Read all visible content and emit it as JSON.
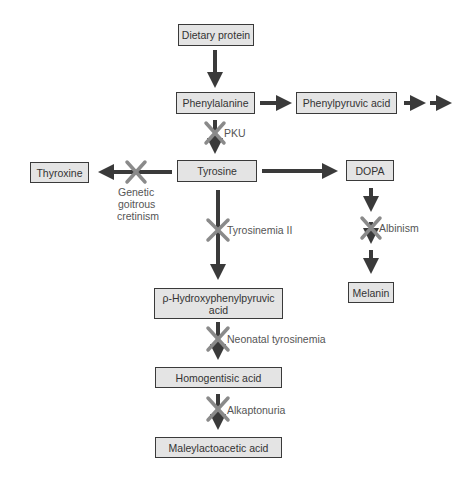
{
  "diagram": {
    "type": "metabolic-pathway",
    "nodes": {
      "dietary_protein": "Dietary protein",
      "phenylalanine": "Phenylalanine",
      "phenylpyruvic_acid": "Phenylpyruvic acid",
      "tyrosine": "Tyrosine",
      "thyroxine": "Thyroxine",
      "dopa": "DOPA",
      "melanin": "Melanin",
      "p_hydroxyphenylpyruvic_acid": "ρ-Hydroxyphenylpyruvic acid",
      "homogentisic_acid": "Homogentisic acid",
      "maleylacetoacetic_acid": "Maleylactoacetic acid"
    },
    "blocks": {
      "pku": "PKU",
      "genetic_goitrous_cretinism_1": "Genetic",
      "genetic_goitrous_cretinism_2": "goitrous",
      "genetic_goitrous_cretinism_3": "cretinism",
      "tyrosinemia_ii": "Tyrosinemia II",
      "albinism": "Albinism",
      "neonatal_tyrosinemia": "Neonatal tyrosinemia",
      "alkaptonuria": "Alkaptonuria"
    },
    "edges": [
      {
        "from": "Dietary protein",
        "to": "Phenylalanine"
      },
      {
        "from": "Phenylalanine",
        "to": "Phenylpyruvic acid"
      },
      {
        "from": "Phenylpyruvic acid",
        "to": "(further products)"
      },
      {
        "from": "Phenylalanine",
        "to": "Tyrosine",
        "blocked_by": "PKU"
      },
      {
        "from": "Tyrosine",
        "to": "Thyroxine",
        "blocked_by": "Genetic goitrous cretinism"
      },
      {
        "from": "Tyrosine",
        "to": "DOPA"
      },
      {
        "from": "DOPA",
        "to": "Melanin",
        "blocked_by": "Albinism"
      },
      {
        "from": "Tyrosine",
        "to": "ρ-Hydroxyphenylpyruvic acid",
        "blocked_by": "Tyrosinemia II"
      },
      {
        "from": "ρ-Hydroxyphenylpyruvic acid",
        "to": "Homogentisic acid",
        "blocked_by": "Neonatal tyrosinemia"
      },
      {
        "from": "Homogentisic acid",
        "to": "Maleylactoacetic acid",
        "blocked_by": "Alkaptonuria"
      }
    ],
    "colors": {
      "arrow": "#3a3a3a",
      "block_x": "#8a8a8a",
      "box_fill": "#e4e4e4"
    }
  }
}
